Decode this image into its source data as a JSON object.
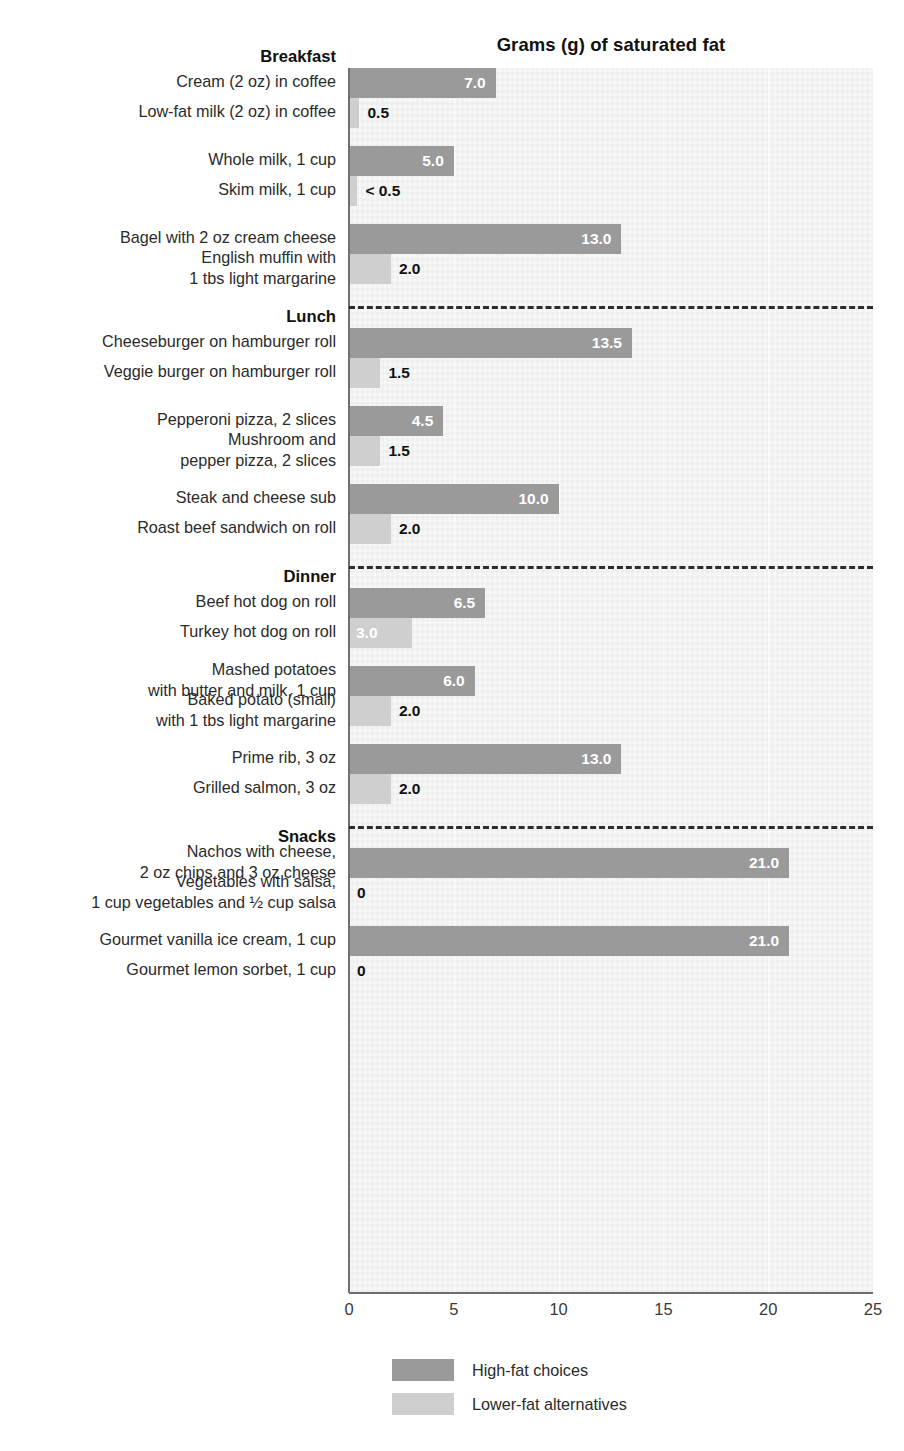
{
  "chart_data": {
    "type": "bar",
    "orientation": "horizontal",
    "title": "Grams (g) of saturated fat",
    "xlabel": "",
    "ylabel": "",
    "xlim": [
      0,
      25
    ],
    "xticks": [
      "0",
      "5",
      "10",
      "15",
      "20",
      "25"
    ],
    "xtick_values": [
      0,
      5,
      10,
      15,
      20,
      25
    ],
    "grid": false,
    "legend_position": "bottom-left",
    "legend": [
      {
        "key": "high",
        "label": "High-fat choices",
        "color": "#9a9a9a"
      },
      {
        "key": "low",
        "label": "Lower-fat alternatives",
        "color": "#cfcfcf"
      }
    ],
    "sections": [
      {
        "name": "Breakfast",
        "pairs": [
          {
            "high": {
              "label": "Cream (2 oz) in coffee",
              "value": 7.0,
              "value_label": "7.0"
            },
            "low": {
              "label": "Low-fat milk (2 oz) in coffee",
              "value": 0.5,
              "value_label": "0.5"
            }
          },
          {
            "high": {
              "label": "Whole milk, 1 cup",
              "value": 5.0,
              "value_label": "5.0"
            },
            "low": {
              "label": "Skim milk, 1 cup",
              "value": 0.4,
              "value_label": "< 0.5"
            }
          },
          {
            "high": {
              "label": "Bagel with 2 oz cream cheese",
              "value": 13.0,
              "value_label": "13.0"
            },
            "low": {
              "label": "English muffin with\n1 tbs light margarine",
              "value": 2.0,
              "value_label": "2.0"
            }
          }
        ]
      },
      {
        "name": "Lunch",
        "pairs": [
          {
            "high": {
              "label": "Cheeseburger on hamburger roll",
              "value": 13.5,
              "value_label": "13.5"
            },
            "low": {
              "label": "Veggie burger on hamburger roll",
              "value": 1.5,
              "value_label": "1.5"
            }
          },
          {
            "high": {
              "label": "Pepperoni pizza, 2 slices",
              "value": 4.5,
              "value_label": "4.5"
            },
            "low": {
              "label": "Mushroom and\npepper pizza, 2 slices",
              "value": 1.5,
              "value_label": "1.5"
            }
          },
          {
            "high": {
              "label": "Steak and cheese sub",
              "value": 10.0,
              "value_label": "10.0"
            },
            "low": {
              "label": "Roast beef sandwich on roll",
              "value": 2.0,
              "value_label": "2.0"
            }
          }
        ]
      },
      {
        "name": "Dinner",
        "pairs": [
          {
            "high": {
              "label": "Beef hot dog on roll",
              "value": 6.5,
              "value_label": "6.5"
            },
            "low": {
              "label": "Turkey hot dog on roll",
              "value": 3.0,
              "value_label": "3.0"
            }
          },
          {
            "high": {
              "label": "Mashed potatoes\nwith butter and milk, 1 cup",
              "value": 6.0,
              "value_label": "6.0"
            },
            "low": {
              "label": "Baked potato (small)\nwith 1 tbs light margarine",
              "value": 2.0,
              "value_label": "2.0"
            }
          },
          {
            "high": {
              "label": "Prime rib, 3 oz",
              "value": 13.0,
              "value_label": "13.0"
            },
            "low": {
              "label": "Grilled salmon, 3 oz",
              "value": 2.0,
              "value_label": "2.0"
            }
          }
        ]
      },
      {
        "name": "Snacks",
        "pairs": [
          {
            "high": {
              "label": "Nachos with cheese,\n2 oz chips and 3 oz cheese",
              "value": 21.0,
              "value_label": "21.0"
            },
            "low": {
              "label": "Vegetables with salsa,\n1 cup vegetables and ½ cup salsa",
              "value": 0,
              "value_label": "0"
            }
          },
          {
            "high": {
              "label": "Gourmet vanilla ice cream, 1 cup",
              "value": 21.0,
              "value_label": "21.0"
            },
            "low": {
              "label": "Gourmet lemon sorbet, 1 cup",
              "value": 0,
              "value_label": "0"
            }
          }
        ]
      }
    ]
  },
  "colors": {
    "high_fat": "#9a9a9a",
    "lower_fat": "#cfcfcf",
    "plot_background": "#f1f1f1",
    "axis": "#6f6f6f",
    "divider": "#2c2c2c",
    "text": "#2b2b2b"
  }
}
